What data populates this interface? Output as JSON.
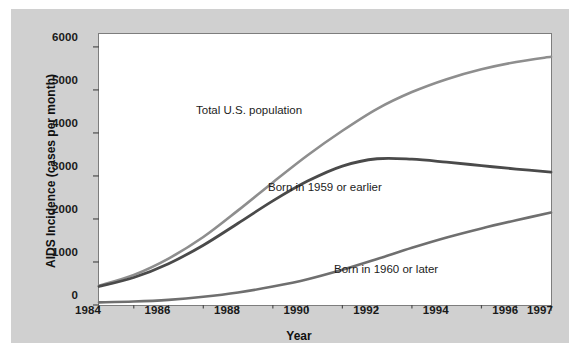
{
  "figure": {
    "background_color": "#ffffff",
    "panel_color": "#d0d0d0",
    "plot_background": "#ffffff",
    "frame_color": "#7d7d7d"
  },
  "chart_data": {
    "type": "line",
    "title": "",
    "xlabel": "Year",
    "ylabel": "AIDS Incidence (cases per month)",
    "xlim": [
      1984,
      1997
    ],
    "ylim": [
      0,
      6300
    ],
    "grid": false,
    "legend_position": "inline-annotations",
    "xticks": [
      "1984",
      "1986",
      "1988",
      "1990",
      "1992",
      "1994",
      "1996",
      "1997"
    ],
    "xtick_values": [
      1984,
      1986,
      1988,
      1990,
      1992,
      1994,
      1996,
      1997
    ],
    "xminor_ticks": [
      1985,
      1987,
      1989,
      1991,
      1993,
      1995
    ],
    "yticks": [
      "0",
      "1000",
      "2000",
      "3000",
      "4000",
      "5000",
      "6000"
    ],
    "ytick_values": [
      0,
      1000,
      2000,
      3000,
      4000,
      5000,
      6000
    ],
    "x": [
      1984,
      1985,
      1986,
      1987,
      1988,
      1989,
      1990,
      1991,
      1992,
      1993,
      1994,
      1995,
      1996,
      1997
    ],
    "series": [
      {
        "name": "Total U.S. population",
        "label": "Total U.S. population",
        "color": "#8e8e8e",
        "line_width": 2.6,
        "values": [
          450,
          700,
          1080,
          1580,
          2200,
          2850,
          3480,
          4050,
          4560,
          4950,
          5250,
          5480,
          5650,
          5770
        ]
      },
      {
        "name": "Born in 1959 or earlier",
        "label": "Born in 1959 or earlier",
        "color": "#4a4a4a",
        "line_width": 2.8,
        "values": [
          430,
          640,
          960,
          1390,
          1900,
          2420,
          2880,
          3230,
          3400,
          3390,
          3320,
          3240,
          3160,
          3090
        ]
      },
      {
        "name": "Born in 1960 or later",
        "label": "Born in 1960 or later",
        "color": "#6f6f6f",
        "line_width": 2.6,
        "values": [
          60,
          80,
          120,
          190,
          290,
          430,
          600,
          820,
          1070,
          1330,
          1570,
          1780,
          1970,
          2150
        ]
      }
    ],
    "annotations": [
      {
        "text": "Total U.S. population",
        "x_px": 196,
        "y_px": 104
      },
      {
        "text": "Born in 1959 or earlier",
        "x_px": 268,
        "y_px": 181
      },
      {
        "text": "Born in 1960 or later",
        "x_px": 334,
        "y_px": 263
      }
    ]
  }
}
